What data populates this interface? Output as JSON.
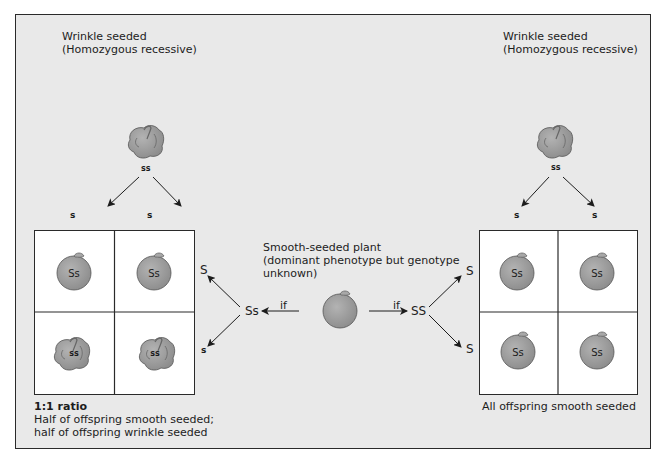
{
  "left_parent": {
    "title_line1": "Wrinkle seeded",
    "title_line2": "(Homozygous recessive)",
    "genotype": "ss",
    "gamete_1": "s",
    "gamete_2": "s"
  },
  "right_parent": {
    "title_line1": "Wrinkle seeded",
    "title_line2": "(Homozygous recessive)",
    "genotype": "ss",
    "gamete_1": "s",
    "gamete_2": "s"
  },
  "center_plant": {
    "line1": "Smooth-seeded plant",
    "line2": "(dominant phenotype but genotype",
    "line3": "unknown)",
    "if_left": "if",
    "if_right": "if",
    "genotype_left": "Ss",
    "genotype_right": "SS"
  },
  "left_cross": {
    "gamete_top": "S",
    "gamete_bottom": "s",
    "cells": [
      {
        "genotype": "Ss",
        "phenotype": "smooth"
      },
      {
        "genotype": "Ss",
        "phenotype": "smooth"
      },
      {
        "genotype": "ss",
        "phenotype": "wrinkled"
      },
      {
        "genotype": "ss",
        "phenotype": "wrinkled"
      }
    ],
    "result_title": "1:1 ratio",
    "result_line1": "Half of offspring smooth seeded;",
    "result_line2": "half of offspring wrinkle seeded"
  },
  "right_cross": {
    "gamete_top": "S",
    "gamete_bottom": "S",
    "cells": [
      {
        "genotype": "Ss",
        "phenotype": "smooth"
      },
      {
        "genotype": "Ss",
        "phenotype": "smooth"
      },
      {
        "genotype": "Ss",
        "phenotype": "smooth"
      },
      {
        "genotype": "Ss",
        "phenotype": "smooth"
      }
    ],
    "result_line1": "All offspring smooth seeded"
  },
  "colors": {
    "background": "#e9e9e9",
    "seed_fill": "#9a9a9a",
    "seed_stroke": "#555555",
    "cell_fill": "#ffffff",
    "line": "#2a2a2a"
  }
}
